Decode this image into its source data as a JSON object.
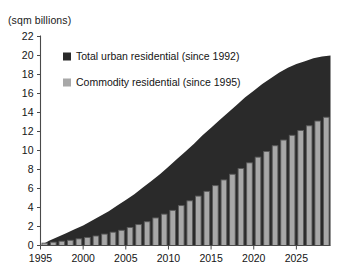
{
  "chart_data": {
    "type": "area",
    "title": "",
    "ylabel": "(sqm billions)",
    "xlabel": "",
    "ylim": [
      0,
      22
    ],
    "ytick_step": 2,
    "yticks": [
      0,
      2,
      4,
      6,
      8,
      10,
      12,
      14,
      16,
      18,
      20,
      22
    ],
    "xticks": [
      1995,
      2000,
      2005,
      2010,
      2015,
      2020,
      2025
    ],
    "xlim": [
      1995,
      2028
    ],
    "grid": false,
    "legend_position": "upper-left-inside",
    "x": [
      1995,
      1996,
      1997,
      1998,
      1999,
      2000,
      2001,
      2002,
      2003,
      2004,
      2005,
      2006,
      2007,
      2008,
      2009,
      2010,
      2011,
      2012,
      2013,
      2014,
      2015,
      2016,
      2017,
      2018,
      2019,
      2020,
      2021,
      2022,
      2023,
      2024,
      2025,
      2026,
      2027,
      2028
    ],
    "series": [
      {
        "name": "Total urban residential (since 1992)",
        "render": "area",
        "color": "#2a2a2a",
        "values": [
          0.5,
          0.9,
          1.3,
          1.7,
          2.1,
          2.6,
          3.1,
          3.6,
          4.2,
          4.8,
          5.4,
          6.1,
          6.8,
          7.5,
          8.3,
          9.1,
          9.9,
          10.7,
          11.6,
          12.4,
          13.2,
          14.0,
          14.8,
          15.6,
          16.3,
          17.0,
          17.6,
          18.2,
          18.7,
          19.1,
          19.4,
          19.7,
          19.9,
          20.0
        ]
      },
      {
        "name": "Commodity residential (since 1995)",
        "render": "bar",
        "color": "#a8a8a8",
        "edge_color": "#5a5a5a",
        "values": [
          0.25,
          0.35,
          0.45,
          0.55,
          0.7,
          0.85,
          1.0,
          1.2,
          1.4,
          1.6,
          1.9,
          2.2,
          2.5,
          2.9,
          3.3,
          3.7,
          4.2,
          4.7,
          5.2,
          5.7,
          6.3,
          6.9,
          7.5,
          8.1,
          8.7,
          9.3,
          9.9,
          10.5,
          11.1,
          11.6,
          12.1,
          12.6,
          13.1,
          13.5
        ]
      }
    ]
  },
  "legend": {
    "items": [
      {
        "label": "Total urban residential (since 1992)",
        "swatch": "#2a2a2a"
      },
      {
        "label": "Commodity residential (since 1995)",
        "swatch": "#a8a8a8"
      }
    ]
  }
}
